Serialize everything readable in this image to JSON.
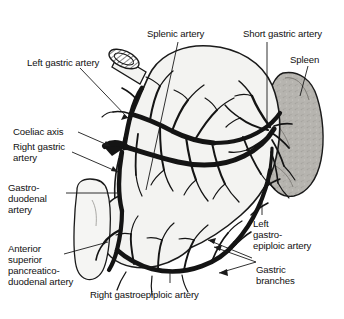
{
  "figure": {
    "background_color": "#ffffff",
    "ink_color": "#111111",
    "organ_fill": "#f2f2f0",
    "spleen_fill": "#b4b2ad",
    "vessel_color": "#141414"
  },
  "labels": {
    "splenic_artery": "Splenic artery",
    "short_gastric_artery": "Short gastric artery",
    "spleen": "Spleen",
    "left_gastric_artery": "Left gastric artery",
    "coeliac_axis": "Coeliac axis",
    "right_gastric_artery_l1": "Right gastric",
    "right_gastric_artery_l2": "artery",
    "gastroduodenal_artery_l1": "Gastro-",
    "gastroduodenal_artery_l2": "duodenal",
    "gastroduodenal_artery_l3": "artery",
    "anterior_superior_pd_l1": "Anterior",
    "anterior_superior_pd_l2": "superior",
    "anterior_superior_pd_l3": "pancreatico-",
    "anterior_superior_pd_l4": "duodenal artery",
    "right_gastroepiploic_artery": "Right gastroepiploic artery",
    "left_gastroepiploic_artery_l1": "Left",
    "left_gastroepiploic_artery_l2": "gastro-",
    "left_gastroepiploic_artery_l3": "epiploic artery",
    "gastric_branches_l1": "Gastric",
    "gastric_branches_l2": "branches"
  },
  "structures": {
    "stomach": "stomach-body",
    "spleen": "spleen",
    "duodenum": "duodenum",
    "oesophagus_cut_end": "oesophagus-cut-end"
  }
}
